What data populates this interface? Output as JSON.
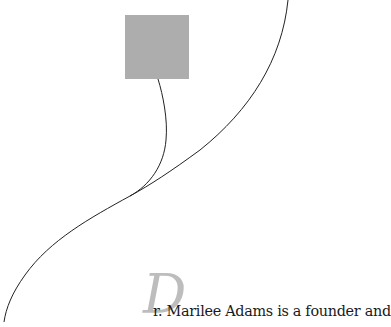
{
  "image": {
    "square_color": "#adadad",
    "curve_color": "#222222"
  },
  "article": {
    "drop_cap": "D",
    "drop_cap_color": "#bdbdbd",
    "first_line": "r. Marilee Adams is a founder and",
    "text_color": "#1a1a1a"
  }
}
